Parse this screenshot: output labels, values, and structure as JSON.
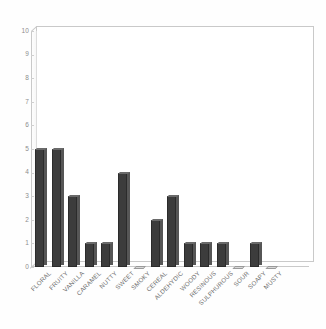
{
  "chart_data": {
    "type": "bar",
    "title": "",
    "subtitle": "",
    "xlabel": "",
    "ylabel": "",
    "ylim": [
      0,
      10
    ],
    "ytick_labels": [
      "0",
      "1",
      "2",
      "3",
      "4",
      "5",
      "6",
      "7",
      "8",
      "9",
      "10"
    ],
    "ytick_values": [
      0,
      1,
      2,
      3,
      4,
      5,
      6,
      7,
      8,
      9,
      10
    ],
    "grid": false,
    "legend": null,
    "legend_position": "none",
    "categories": [
      "FLORAL",
      "FRUITY",
      "VANILLA",
      "CARAMEL",
      "NUTTY",
      "SWEET",
      "SMOKY",
      "CEREAL",
      "ALDEHYDIC",
      "WOODY",
      "RESINOUS",
      "SULPHUROUS",
      "SOUR",
      "SOAPY",
      "MUSTY"
    ],
    "values": [
      5,
      5,
      3,
      1,
      1,
      4,
      0,
      2,
      3,
      1,
      1,
      1,
      0,
      1,
      0
    ],
    "series": [
      {
        "name": "",
        "values": [
          5,
          5,
          3,
          1,
          1,
          4,
          0,
          2,
          3,
          1,
          1,
          1,
          0,
          1,
          0
        ]
      }
    ],
    "colors": {
      "bar_face": "#3c3c3c",
      "bar_side": "#565656",
      "bar_top": "#6a6a6a",
      "axis": "#c9c9c9",
      "tick_text": "#8d8d8d",
      "label_text": "#6f6f6f",
      "background": "#fefefe"
    }
  }
}
